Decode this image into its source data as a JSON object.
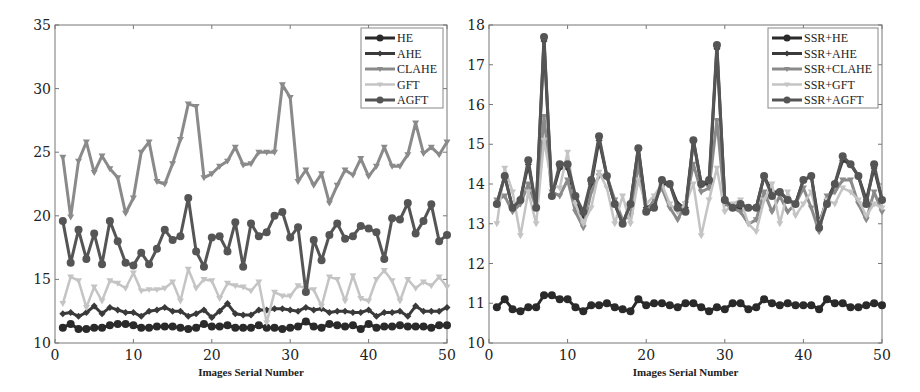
{
  "chart_data": [
    {
      "type": "line",
      "title": "",
      "xlabel": "Images Serial Number",
      "ylabel": "",
      "xlim": [
        0,
        50
      ],
      "ylim": [
        10,
        35
      ],
      "xticks": [
        0,
        10,
        20,
        30,
        40,
        50
      ],
      "yticks": [
        10,
        15,
        20,
        25,
        30,
        35
      ],
      "grid": false,
      "legend_position": "upper right",
      "x": [
        1,
        2,
        3,
        4,
        5,
        6,
        7,
        8,
        9,
        10,
        11,
        12,
        13,
        14,
        15,
        16,
        17,
        18,
        19,
        20,
        21,
        22,
        23,
        24,
        25,
        26,
        27,
        28,
        29,
        30,
        31,
        32,
        33,
        34,
        35,
        36,
        37,
        38,
        39,
        40,
        41,
        42,
        43,
        44,
        45,
        46,
        47,
        48,
        49,
        50
      ],
      "series": [
        {
          "name": "HE",
          "color": "#2a2a2a",
          "marker": "circle",
          "width": 3,
          "values": [
            11.2,
            11.5,
            11.1,
            11.1,
            11.2,
            11.2,
            11.4,
            11.5,
            11.5,
            11.4,
            11.2,
            11.2,
            11.3,
            11.3,
            11.3,
            11.2,
            11.1,
            11.2,
            11.5,
            11.3,
            11.3,
            11.4,
            11.2,
            11.2,
            11.2,
            11.4,
            11.2,
            11.2,
            11.1,
            11.2,
            11.3,
            11.7,
            11.3,
            11.2,
            11.5,
            11.4,
            11.3,
            11.4,
            11.1,
            11.5,
            11.2,
            11.3,
            11.3,
            11.4,
            11.3,
            11.3,
            11.3,
            11.2,
            11.4,
            11.4
          ]
        },
        {
          "name": "AHE",
          "color": "#3a3a3a",
          "marker": "diamond",
          "width": 3,
          "values": [
            12.3,
            12.4,
            12.1,
            12.4,
            12.9,
            12.3,
            12.8,
            12.6,
            12.4,
            12.4,
            12.1,
            12.5,
            12.6,
            12.8,
            12.5,
            12.5,
            12.1,
            12.3,
            12.6,
            12.0,
            12.5,
            13.1,
            12.3,
            12.2,
            12.2,
            12.6,
            12.6,
            12.7,
            12.7,
            12.6,
            12.5,
            12.8,
            12.6,
            12.7,
            12.4,
            12.5,
            12.5,
            12.4,
            12.4,
            12.6,
            12.1,
            12.4,
            12.4,
            12.5,
            12.1,
            12.9,
            12.5,
            12.5,
            12.5,
            12.8
          ]
        },
        {
          "name": "CLAHE",
          "color": "#8a8a8a",
          "marker": "triangle",
          "width": 3,
          "values": [
            24.6,
            19.9,
            24.3,
            25.8,
            23.4,
            24.7,
            23.7,
            23.0,
            20.2,
            21.4,
            25.0,
            25.8,
            22.7,
            22.5,
            24.1,
            26.0,
            28.8,
            28.6,
            23.0,
            23.3,
            23.9,
            24.3,
            25.4,
            24.0,
            24.1,
            25.0,
            25.0,
            25.0,
            30.3,
            29.3,
            22.7,
            23.6,
            22.4,
            23.3,
            21.0,
            22.4,
            23.6,
            23.2,
            24.5,
            23.1,
            23.9,
            25.4,
            23.9,
            23.9,
            24.8,
            27.3,
            24.9,
            25.4,
            24.8,
            25.8
          ]
        },
        {
          "name": "GFT",
          "color": "#c4c4c4",
          "marker": "triangle",
          "width": 2.5,
          "values": [
            13.1,
            15.2,
            14.9,
            12.8,
            14.4,
            13.3,
            14.9,
            14.7,
            14.3,
            15.5,
            14.1,
            14.2,
            14.2,
            14.3,
            14.8,
            13.3,
            15.8,
            14.3,
            15.0,
            14.9,
            13.5,
            14.7,
            14.5,
            14.4,
            14.1,
            14.8,
            11.6,
            14.0,
            13.7,
            13.7,
            14.5,
            14.3,
            14.2,
            12.9,
            15.2,
            15.0,
            13.3,
            15.3,
            13.5,
            13.3,
            15.0,
            15.7,
            14.9,
            13.3,
            15.0,
            14.3,
            14.8,
            14.5,
            15.2,
            14.4
          ]
        },
        {
          "name": "AGFT",
          "color": "#555555",
          "marker": "circle",
          "width": 3,
          "values": [
            19.6,
            16.3,
            18.9,
            16.6,
            18.6,
            16.2,
            19.6,
            18.0,
            16.3,
            16.1,
            17.1,
            16.2,
            17.4,
            18.9,
            18.1,
            18.4,
            21.4,
            17.2,
            16.0,
            18.3,
            18.4,
            17.2,
            19.5,
            16.0,
            19.4,
            18.4,
            18.7,
            20.0,
            20.3,
            18.3,
            19.1,
            14.0,
            18.1,
            16.5,
            18.5,
            19.4,
            18.2,
            18.4,
            19.2,
            19.0,
            18.7,
            16.6,
            19.8,
            19.7,
            21.0,
            18.6,
            19.6,
            20.9,
            18.0,
            18.5
          ]
        }
      ]
    },
    {
      "type": "line",
      "title": "",
      "xlabel": "Images Serial Number",
      "ylabel": "",
      "xlim": [
        0,
        50
      ],
      "ylim": [
        10,
        18
      ],
      "xticks": [
        0,
        10,
        20,
        30,
        40,
        50
      ],
      "yticks": [
        10,
        11,
        12,
        13,
        14,
        15,
        16,
        17,
        18
      ],
      "grid": false,
      "legend_position": "upper right",
      "x": [
        1,
        2,
        3,
        4,
        5,
        6,
        7,
        8,
        9,
        10,
        11,
        12,
        13,
        14,
        15,
        16,
        17,
        18,
        19,
        20,
        21,
        22,
        23,
        24,
        25,
        26,
        27,
        28,
        29,
        30,
        31,
        32,
        33,
        34,
        35,
        36,
        37,
        38,
        39,
        40,
        41,
        42,
        43,
        44,
        45,
        46,
        47,
        48,
        49,
        50
      ],
      "series": [
        {
          "name": "SSR+HE",
          "color": "#2a2a2a",
          "marker": "circle",
          "width": 3,
          "values": [
            10.9,
            11.1,
            10.85,
            10.8,
            10.9,
            10.9,
            11.2,
            11.2,
            11.1,
            11.1,
            10.9,
            10.8,
            10.95,
            10.95,
            11.0,
            10.9,
            10.85,
            10.8,
            11.1,
            10.95,
            11.0,
            11.0,
            10.95,
            10.9,
            11.0,
            11.0,
            10.9,
            10.8,
            10.9,
            10.85,
            11.0,
            11.0,
            10.85,
            10.9,
            11.1,
            11.0,
            10.95,
            11.0,
            10.95,
            10.95,
            10.95,
            10.85,
            11.1,
            11.0,
            11.0,
            10.9,
            10.9,
            10.95,
            11.0,
            10.95
          ]
        },
        {
          "name": "SSR+AHE",
          "color": "#3a3a3a",
          "marker": "diamond",
          "width": 3,
          "values": [
            13.5,
            14.2,
            13.4,
            13.6,
            14.5,
            13.4,
            17.6,
            13.7,
            14.4,
            14.4,
            13.6,
            13.2,
            14.0,
            15.1,
            14.2,
            13.5,
            13.0,
            13.5,
            14.9,
            13.4,
            13.5,
            14.0,
            14.0,
            13.5,
            13.4,
            15.1,
            14.0,
            14.0,
            17.4,
            13.6,
            13.4,
            13.4,
            13.4,
            13.4,
            14.2,
            13.8,
            13.8,
            13.6,
            13.5,
            14.1,
            14.2,
            13.0,
            13.6,
            14.0,
            14.6,
            14.5,
            14.2,
            13.6,
            14.4,
            13.6
          ]
        },
        {
          "name": "SSR+CLAHE",
          "color": "#8a8a8a",
          "marker": "triangle",
          "width": 3,
          "values": [
            13.6,
            13.7,
            13.3,
            13.5,
            14.0,
            13.4,
            15.7,
            13.8,
            13.7,
            14.1,
            13.3,
            12.9,
            13.8,
            14.2,
            14.2,
            13.6,
            13.1,
            13.2,
            14.5,
            13.3,
            13.6,
            13.9,
            13.4,
            13.1,
            13.5,
            14.5,
            13.8,
            13.9,
            15.6,
            13.5,
            13.4,
            13.3,
            13.0,
            13.1,
            13.8,
            13.3,
            13.7,
            13.3,
            13.5,
            13.9,
            13.4,
            12.8,
            13.7,
            13.8,
            14.1,
            14.1,
            13.5,
            13.1,
            13.8,
            13.3
          ]
        },
        {
          "name": "SSR+GFT",
          "color": "#c4c4c4",
          "marker": "triangle",
          "width": 2.5,
          "values": [
            13.0,
            14.4,
            13.8,
            12.7,
            13.8,
            13.0,
            15.1,
            14.0,
            13.9,
            14.8,
            13.5,
            13.0,
            13.4,
            14.3,
            13.9,
            13.0,
            13.7,
            13.0,
            14.1,
            13.5,
            13.7,
            14.0,
            13.5,
            13.3,
            13.5,
            14.0,
            12.7,
            13.6,
            14.4,
            13.3,
            13.5,
            13.6,
            13.0,
            12.8,
            13.6,
            14.0,
            13.0,
            13.8,
            13.2,
            13.5,
            13.8,
            13.0,
            13.6,
            13.5,
            13.9,
            13.8,
            13.6,
            13.2,
            13.5,
            13.4
          ]
        },
        {
          "name": "SSR+AGFT",
          "color": "#555555",
          "marker": "circle",
          "width": 3,
          "values": [
            13.5,
            14.2,
            13.4,
            13.6,
            14.6,
            13.4,
            17.7,
            13.7,
            14.5,
            14.5,
            13.7,
            13.3,
            14.1,
            15.2,
            14.2,
            13.5,
            13.0,
            13.5,
            14.9,
            13.3,
            13.4,
            14.1,
            14.0,
            13.4,
            13.3,
            15.1,
            14.0,
            14.1,
            17.5,
            13.6,
            13.4,
            13.5,
            13.4,
            13.4,
            14.2,
            13.7,
            13.8,
            13.6,
            13.5,
            14.1,
            14.2,
            12.9,
            13.5,
            14.0,
            14.7,
            14.5,
            14.2,
            13.5,
            14.5,
            13.6
          ]
        }
      ]
    }
  ]
}
